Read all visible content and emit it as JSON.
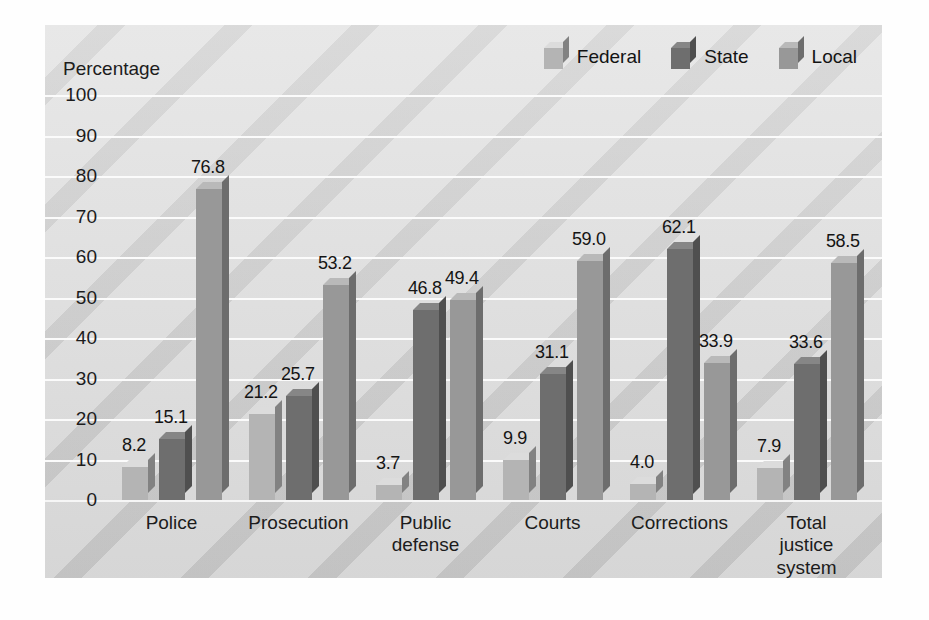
{
  "chart_data": {
    "type": "bar",
    "title": "",
    "subtitle": "",
    "xlabel": "",
    "ylabel": "Percentage",
    "ylim": [
      0,
      100
    ],
    "ytick_step": 10,
    "yticks": [
      "100",
      "90",
      "80",
      "70",
      "60",
      "50",
      "40",
      "30",
      "20",
      "10",
      "0"
    ],
    "grid": true,
    "legend_position": "top-right",
    "categories": [
      "Police",
      "Prosecution",
      "Public defense",
      "Courts",
      "Corrections",
      "Total justice system"
    ],
    "category_lines": [
      [
        "Police"
      ],
      [
        "Prosecution"
      ],
      [
        "Public",
        "defense"
      ],
      [
        "Courts"
      ],
      [
        "Corrections"
      ],
      [
        "Total",
        "justice",
        "system"
      ]
    ],
    "series": [
      {
        "name": "Federal",
        "color": "#b4b4b4",
        "values": [
          8.2,
          21.2,
          3.7,
          9.9,
          4.0,
          7.9
        ],
        "labels": [
          "8.2",
          "21.2",
          "3.7",
          "9.9",
          "4.0",
          "7.9"
        ]
      },
      {
        "name": "State",
        "color": "#6e6e6e",
        "values": [
          15.1,
          25.7,
          46.8,
          31.1,
          62.1,
          33.6
        ],
        "labels": [
          "15.1",
          "25.7",
          "46.8",
          "31.1",
          "62.1",
          "33.6"
        ]
      },
      {
        "name": "Local",
        "color": "#989898",
        "values": [
          76.8,
          53.2,
          49.4,
          59.0,
          33.9,
          58.5
        ],
        "labels": [
          "76.8",
          "53.2",
          "49.4",
          "59.0",
          "33.9",
          "58.5"
        ]
      }
    ]
  },
  "legend": {
    "items": [
      {
        "label": "Federal",
        "color": "#b4b4b4"
      },
      {
        "label": "State",
        "color": "#6e6e6e"
      },
      {
        "label": "Local",
        "color": "#989898"
      }
    ]
  },
  "axis": {
    "y_title": "Percentage"
  },
  "colors": {
    "panel_background": "#dedede",
    "gridline": "#fbfbfb",
    "text": "#1c1c1c",
    "federal": "#b4b4b4",
    "state": "#6e6e6e",
    "local": "#989898"
  }
}
